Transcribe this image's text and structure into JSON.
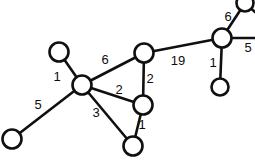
{
  "figure": {
    "width": 255,
    "height": 161,
    "background_color": "#ffffff",
    "stroke_color": "#101010",
    "label_color": "#0d0d0d"
  },
  "chart_data": {
    "type": "diagram",
    "subtype": "node-link-graph",
    "title": "",
    "xlabel": "",
    "ylabel": "",
    "grid": false,
    "legend": "none",
    "directed": false,
    "weighted": true,
    "node_radius": 9,
    "nodes": [
      {
        "id": "n1",
        "label": "",
        "x": 59,
        "y": 52,
        "r": 9.5,
        "clipped": false
      },
      {
        "id": "n2",
        "label": "",
        "x": 82,
        "y": 85,
        "r": 9.5,
        "clipped": false
      },
      {
        "id": "n3",
        "label": "",
        "x": 12,
        "y": 139,
        "r": 9.5,
        "clipped": false
      },
      {
        "id": "n4",
        "label": "",
        "x": 144,
        "y": 53,
        "r": 9.5,
        "clipped": false
      },
      {
        "id": "n5",
        "label": "",
        "x": 143,
        "y": 105,
        "r": 9.5,
        "clipped": false
      },
      {
        "id": "n6",
        "label": "",
        "x": 133,
        "y": 146,
        "r": 9.5,
        "clipped": false
      },
      {
        "id": "n7",
        "label": "",
        "x": 222,
        "y": 38,
        "r": 9.5,
        "clipped": false
      },
      {
        "id": "n8",
        "label": "",
        "x": 220,
        "y": 87,
        "r": 8.5,
        "clipped": false
      },
      {
        "id": "n9",
        "label": "",
        "x": 245,
        "y": 3,
        "r": 8.5,
        "clipped": true
      }
    ],
    "edges": [
      {
        "id": "e1",
        "source": "n1",
        "target": "n2",
        "weight": 1,
        "label_x": 57,
        "label_y": 76
      },
      {
        "id": "e2",
        "source": "n3",
        "target": "n2",
        "weight": 5,
        "label_x": 38,
        "label_y": 104
      },
      {
        "id": "e3",
        "source": "n2",
        "target": "n4",
        "weight": 6,
        "label_x": 105,
        "label_y": 59
      },
      {
        "id": "e4",
        "source": "n2",
        "target": "n5",
        "weight": 2,
        "label_x": 119,
        "label_y": 89
      },
      {
        "id": "e5",
        "source": "n2",
        "target": "n6",
        "weight": 3,
        "label_x": 96,
        "label_y": 112
      },
      {
        "id": "e6",
        "source": "n4",
        "target": "n5",
        "weight": 2,
        "label_x": 150,
        "label_y": 78
      },
      {
        "id": "e7",
        "source": "n5",
        "target": "n6",
        "weight": 1,
        "label_x": 142,
        "label_y": 124
      },
      {
        "id": "e8",
        "source": "n4",
        "target": "n7",
        "weight": 19,
        "label_x": 178,
        "label_y": 60
      },
      {
        "id": "e9",
        "source": "n7",
        "target": "n8",
        "weight": 1,
        "label_x": 213,
        "label_y": 62
      },
      {
        "id": "e10",
        "source": "n7",
        "target": "n9",
        "weight": 6,
        "label_x": 228,
        "label_y": 16
      },
      {
        "id": "e11",
        "source": "n7",
        "target": "edge-right",
        "weight": 5,
        "label_x": 248,
        "label_y": 47
      }
    ],
    "open_edges": [
      {
        "id": "o1",
        "from": "n7",
        "to_x": 255,
        "to_y": 38,
        "note": "continues off right border"
      },
      {
        "id": "o2",
        "from": "n9",
        "to_x": 255,
        "to_y": 12,
        "note": "continues off right border"
      }
    ],
    "weight_labels": [
      "1",
      "5",
      "6",
      "2",
      "3",
      "2",
      "1",
      "19",
      "1",
      "6",
      "5"
    ]
  },
  "caption": {
    "text": "",
    "x": 60,
    "y": 157
  }
}
